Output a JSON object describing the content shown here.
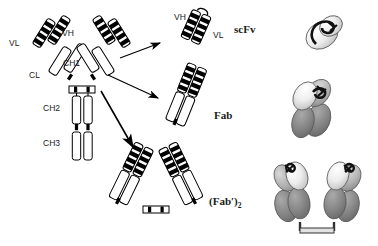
{
  "figure": {
    "background_color": "#ffffff",
    "ink_color": "#000000",
    "fill_light": "#ffffff",
    "fill_dark": "#000000",
    "model_light_gray": "#e8e8e8",
    "model_mid_gray": "#b8b8b8",
    "model_dark_gray": "#808080"
  },
  "domain_labels": {
    "vl": "VL",
    "vh": "VH",
    "cl": "CL",
    "ch1": "CH1",
    "ch2": "CH2",
    "ch3": "CH3"
  },
  "fragment_labels": {
    "scfv": "scFv",
    "fab": "Fab",
    "fab2_main": "(Fab",
    "fab2_prime": "′)",
    "fab2_sub": "2"
  },
  "scfv_callouts": {
    "vh": "VH",
    "vl": "VL"
  },
  "panels": [
    {
      "name": "intact-igg",
      "description": "Whole IgG antibody schematic with VL, VH, CL, CH1, CH2, CH3 domains",
      "labels": [
        "VL",
        "VH",
        "CL",
        "CH1",
        "CH2",
        "CH3"
      ]
    },
    {
      "name": "scfv-fragment",
      "description": "Single chain variable fragment, VH linked to VL",
      "labels": [
        "VH",
        "VL",
        "scFv"
      ]
    },
    {
      "name": "fab-fragment",
      "description": "Fab fragment, one arm with variable and constant domains",
      "labels": [
        "Fab"
      ]
    },
    {
      "name": "fab2-fragment",
      "description": "F(ab')2 fragment, two Fab arms joined at hinge disulfides",
      "labels": [
        "(Fab′)2"
      ]
    },
    {
      "name": "scfv-3d-model",
      "description": "Space filling 3D model of scFv"
    },
    {
      "name": "fab-3d-model",
      "description": "Space filling 3D model of Fab"
    },
    {
      "name": "fab2-3d-model",
      "description": "Space filling 3D model of F(ab')2 dimer"
    }
  ],
  "arrows": [
    {
      "name": "arrow-to-scfv",
      "from": "intact-igg",
      "to": "scfv-fragment"
    },
    {
      "name": "arrow-to-fab",
      "from": "intact-igg",
      "to": "fab-fragment"
    },
    {
      "name": "arrow-to-fab2",
      "from": "intact-igg",
      "to": "fab2-fragment"
    }
  ]
}
